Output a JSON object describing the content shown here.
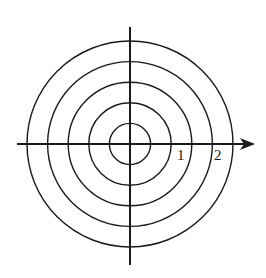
{
  "diagram": {
    "type": "polar-grid",
    "center": {
      "x": 130,
      "y": 144
    },
    "circle_radii_px": [
      20.6,
      41.2,
      61.8,
      82.4,
      103
    ],
    "circle_values": [
      0.5,
      1,
      1.5,
      2,
      2.5
    ],
    "stroke_color": "#1a1a1a",
    "axes": {
      "horizontal": {
        "x1": 17,
        "x2": 244,
        "y": 144,
        "arrow": true,
        "arrow_tip_x": 255
      },
      "vertical": {
        "x": 130,
        "y1": 27,
        "y2": 265,
        "arrow": false
      }
    },
    "labels": [
      {
        "text": "1",
        "x": 177,
        "y": 160
      },
      {
        "text": "2",
        "x": 214,
        "y": 160
      }
    ]
  }
}
